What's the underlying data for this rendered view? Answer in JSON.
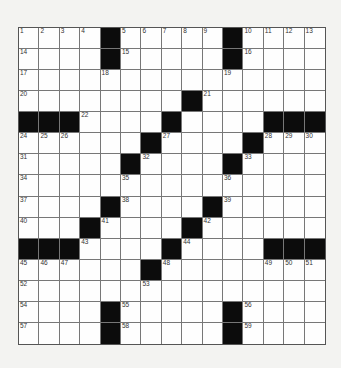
{
  "puzzle": {
    "rows": 15,
    "cols": 15,
    "grid": [
      "....#.....#....",
      "....#.....#....",
      "...............",
      "........#......",
      "###...#.....###",
      "......#....#...",
      ".....#....#....",
      "...............",
      "....#....#.....",
      "...#....#......",
      "###....#....###",
      "......#.....",
      "...............",
      "....#.....#....",
      "....#.....#...."
    ],
    "numbers": [
      [
        0,
        0,
        1
      ],
      [
        0,
        1,
        2
      ],
      [
        0,
        2,
        3
      ],
      [
        0,
        3,
        4
      ],
      [
        0,
        5,
        5
      ],
      [
        0,
        6,
        6
      ],
      [
        0,
        7,
        7
      ],
      [
        0,
        8,
        8
      ],
      [
        0,
        9,
        9
      ],
      [
        0,
        11,
        10
      ],
      [
        0,
        12,
        11
      ],
      [
        0,
        13,
        12
      ],
      [
        0,
        14,
        13
      ],
      [
        1,
        0,
        14
      ],
      [
        1,
        5,
        15
      ],
      [
        1,
        11,
        16
      ],
      [
        2,
        0,
        17
      ],
      [
        2,
        4,
        18
      ],
      [
        2,
        10,
        19
      ],
      [
        3,
        0,
        20
      ],
      [
        3,
        9,
        21
      ],
      [
        4,
        3,
        22
      ],
      [
        4,
        7,
        23
      ],
      [
        5,
        0,
        24
      ],
      [
        5,
        1,
        25
      ],
      [
        5,
        2,
        26
      ],
      [
        5,
        7,
        27
      ],
      [
        5,
        12,
        28
      ],
      [
        5,
        13,
        29
      ],
      [
        5,
        14,
        30
      ],
      [
        6,
        0,
        31
      ],
      [
        6,
        6,
        32
      ],
      [
        6,
        11,
        33
      ],
      [
        7,
        0,
        34
      ],
      [
        7,
        5,
        35
      ],
      [
        7,
        10,
        36
      ],
      [
        8,
        0,
        37
      ],
      [
        8,
        5,
        38
      ],
      [
        8,
        10,
        39
      ],
      [
        9,
        0,
        40
      ],
      [
        9,
        4,
        41
      ],
      [
        9,
        9,
        42
      ],
      [
        10,
        3,
        43
      ],
      [
        10,
        8,
        44
      ],
      [
        11,
        0,
        45
      ],
      [
        11,
        1,
        46
      ],
      [
        11,
        2,
        47
      ],
      [
        11,
        7,
        48
      ],
      [
        11,
        12,
        49
      ],
      [
        11,
        13,
        50
      ],
      [
        11,
        14,
        51
      ],
      [
        12,
        0,
        52
      ],
      [
        12,
        6,
        53
      ],
      [
        13,
        0,
        54
      ],
      [
        13,
        5,
        55
      ],
      [
        13,
        11,
        56
      ],
      [
        14,
        0,
        57
      ],
      [
        14,
        5,
        58
      ],
      [
        14,
        11,
        59
      ]
    ]
  }
}
